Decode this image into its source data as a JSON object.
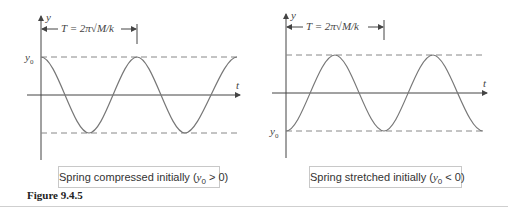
{
  "figure": {
    "label": "Figure 9.4.5",
    "period_label": "T = 2π√M/k",
    "panels": [
      {
        "id": "left",
        "caption_text": "Spring compressed initially (",
        "caption_var": "y",
        "caption_sub": "0",
        "caption_rel": " > 0)",
        "y_axis_label": "y",
        "t_axis_label": "t",
        "y0_label": "y",
        "y0_sub": "0",
        "initial": "max"
      },
      {
        "id": "right",
        "caption_text": "Spring stretched initially (",
        "caption_var": "y",
        "caption_sub": "0",
        "caption_rel": " < 0)",
        "y_axis_label": "y",
        "t_axis_label": "t",
        "y0_label": "y",
        "y0_sub": "0",
        "initial": "min"
      }
    ]
  },
  "colors": {
    "curve": "#777777",
    "axis": "#444444",
    "dashed": "#888888"
  }
}
